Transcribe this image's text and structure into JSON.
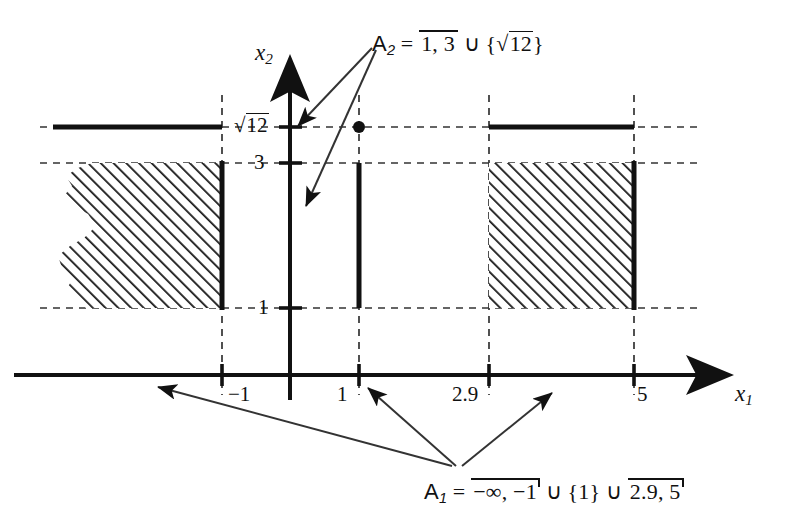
{
  "figure": {
    "type": "math-set-diagram",
    "axes": {
      "x_label": "x",
      "x_sub": "1",
      "y_label": "x",
      "y_sub": "2"
    },
    "x_ticks": [
      {
        "value": "-1",
        "text": "−1",
        "px": 222
      },
      {
        "value": "1",
        "text": "1",
        "px": 359
      },
      {
        "value": "2.9",
        "text": "2.9",
        "px": 489
      },
      {
        "value": "5",
        "text": "5",
        "px": 634
      }
    ],
    "y_ticks": [
      {
        "value": "sqrt12",
        "text": "12",
        "prefix": "√",
        "px": 127
      },
      {
        "value": "3",
        "text": "3",
        "px": 163
      },
      {
        "value": "1",
        "text": "1",
        "px": 308
      }
    ],
    "annotations": [
      {
        "name": "a2-label",
        "parts": {
          "set": "A",
          "set_sub": "2",
          "equals": "=",
          "interval": "1, 3",
          "union": "∪",
          "brace_open": "{",
          "radical": "√",
          "radicand": "12",
          "brace_close": "}"
        }
      },
      {
        "name": "a1-label",
        "parts": {
          "set": "A",
          "set_sub": "1",
          "equals": "=",
          "interval_1": "−∞, −1",
          "union_1": "∪",
          "brace_open": "{",
          "singleton": "1",
          "brace_close": "}",
          "union_2": "∪",
          "interval_2": "2.9, 5"
        }
      }
    ],
    "regions": [
      {
        "name": "left-hatched-band",
        "x_from": "-infinity",
        "x_to": "-1",
        "y_from": "1",
        "y_to": "3",
        "ragged_left": true
      },
      {
        "name": "middle-segment",
        "x_at": "1",
        "y_from": "1",
        "y_to": "3"
      },
      {
        "name": "right-hatched-band",
        "x_from": "2.9",
        "x_to": "5",
        "y_from": "1",
        "y_to": "3"
      },
      {
        "name": "left-sqrt12-line",
        "x_from": "-infinity",
        "x_to": "-1",
        "y_at": "sqrt12"
      },
      {
        "name": "point-1-sqrt12",
        "x_at": "1",
        "y_at": "sqrt12"
      },
      {
        "name": "right-sqrt12-line",
        "x_from": "2.9",
        "x_to": "5",
        "y_at": "sqrt12"
      }
    ],
    "colors": {
      "ink": "#111111",
      "paper": "#ffffff"
    }
  }
}
